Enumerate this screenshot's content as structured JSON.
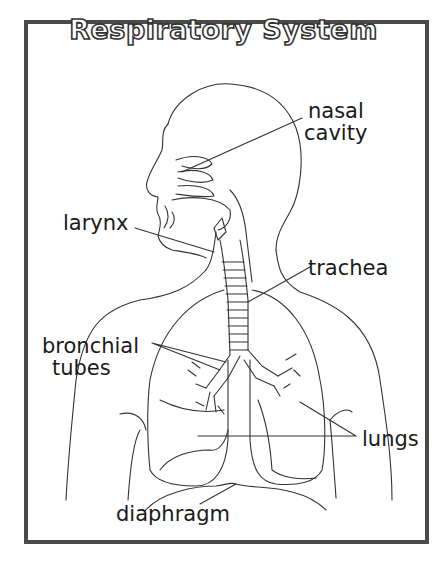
{
  "title": "Respiratory System",
  "labels": {
    "nasal_cavity_line1": "nasal",
    "nasal_cavity_line2": "cavity",
    "larynx": "larynx",
    "trachea": "trachea",
    "bronchial_line1": "bronchial",
    "bronchial_line2": "tubes",
    "lungs": "lungs",
    "diaphragm": "diaphragm"
  },
  "colors": {
    "frame": "#4a4a4a",
    "line": "#333333",
    "background": "#ffffff"
  }
}
